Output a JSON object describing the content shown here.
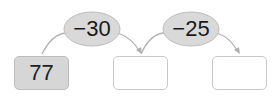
{
  "diagram": {
    "start_value": "77",
    "operations": [
      {
        "label": "−30"
      },
      {
        "label": "−25"
      }
    ],
    "boxes": [
      {
        "value": "77",
        "filled": true
      },
      {
        "value": "",
        "filled": false
      },
      {
        "value": "",
        "filled": false
      }
    ],
    "colors": {
      "ellipse_fill": "#d9d9d9",
      "box_filled": "#d6d6d6",
      "line": "#b0b0b0"
    }
  }
}
